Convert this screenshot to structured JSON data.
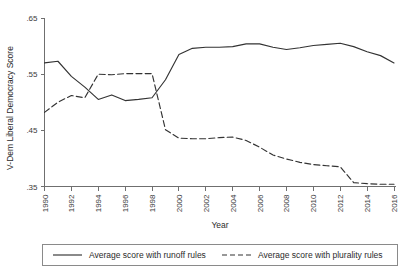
{
  "chart_data": {
    "type": "line",
    "title": "",
    "xlabel": "Year",
    "ylabel": "V-Dem Liberal Democracy Score",
    "xlim": [
      1990,
      2016
    ],
    "ylim": [
      0.35,
      0.65
    ],
    "grid": false,
    "legend_position": "bottom",
    "y_ticks": [
      ".65",
      ".55",
      ".45",
      ".35"
    ],
    "y_tick_values": [
      0.65,
      0.55,
      0.45,
      0.35
    ],
    "x_ticks": [
      "1990",
      "1992",
      "1994",
      "1996",
      "1998",
      "2000",
      "2002",
      "2004",
      "2006",
      "2008",
      "2010",
      "2012",
      "2014",
      "2016"
    ],
    "x_tick_values": [
      1990,
      1992,
      1994,
      1996,
      1998,
      2000,
      2002,
      2004,
      2006,
      2008,
      2010,
      2012,
      2014,
      2016
    ],
    "x": [
      1990,
      1991,
      1992,
      1993,
      1994,
      1995,
      1996,
      1997,
      1998,
      1999,
      2000,
      2001,
      2002,
      2003,
      2004,
      2005,
      2006,
      2007,
      2008,
      2009,
      2010,
      2011,
      2012,
      2013,
      2014,
      2015,
      2016
    ],
    "series": [
      {
        "name": "Average score with runoff rules",
        "style": "solid",
        "color": "#333333",
        "values": [
          0.57,
          0.573,
          0.546,
          0.527,
          0.505,
          0.513,
          0.503,
          0.505,
          0.508,
          0.54,
          0.585,
          0.596,
          0.598,
          0.598,
          0.599,
          0.604,
          0.604,
          0.598,
          0.594,
          0.597,
          0.601,
          0.603,
          0.605,
          0.599,
          0.59,
          0.583,
          0.57
        ]
      },
      {
        "name": "Average score with plurality rules",
        "style": "dashed",
        "color": "#333333",
        "values": [
          0.482,
          0.5,
          0.512,
          0.508,
          0.55,
          0.549,
          0.551,
          0.551,
          0.551,
          0.451,
          0.436,
          0.435,
          0.435,
          0.437,
          0.438,
          0.432,
          0.42,
          0.406,
          0.399,
          0.393,
          0.389,
          0.387,
          0.385,
          0.357,
          0.355,
          0.354,
          0.354
        ]
      }
    ]
  },
  "legend": {
    "entries": [
      {
        "label": "Average score with runoff rules",
        "style": "solid"
      },
      {
        "label": "Average score with plurality rules",
        "style": "dashed"
      }
    ]
  }
}
